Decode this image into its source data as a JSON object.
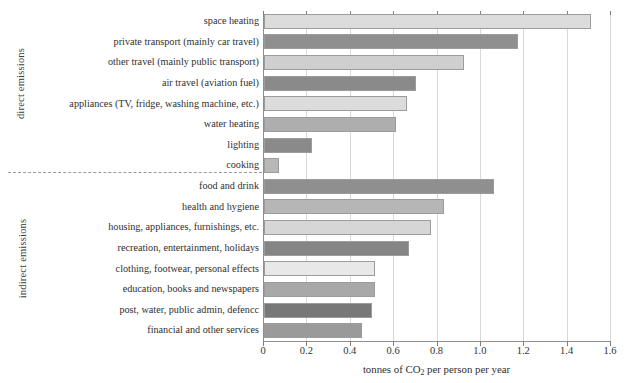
{
  "chart_data": {
    "type": "bar",
    "orientation": "horizontal",
    "title": "",
    "xlabel": "tonnes of CO2 per person per year",
    "xlabel_parts": {
      "before": "tonnes of CO",
      "sub": "2",
      "after": " per person per year"
    },
    "ylabel": "",
    "xlim": [
      0,
      1.6
    ],
    "xticks": [
      0,
      0.2,
      0.4,
      0.6,
      0.8,
      1.0,
      1.2,
      1.4,
      1.6
    ],
    "xtick_labels": [
      "0",
      "0.2",
      "0.4",
      "0.6",
      "0.8",
      "1.0",
      "1.2",
      "1.4",
      "1.6"
    ],
    "grid": true,
    "legend": "none",
    "groups": [
      {
        "name": "direct emissions",
        "categories": [
          "space heating",
          "private transport (mainly car travel)",
          "other travel (mainly public transport)",
          "air travel (aviation fuel)",
          "appliances (TV, fridge, washing machine, etc.)",
          "water heating",
          "lighting",
          "cooking"
        ],
        "values": [
          1.51,
          1.17,
          0.92,
          0.7,
          0.66,
          0.61,
          0.22,
          0.07
        ],
        "colors": [
          "#dcdcdc",
          "#8f8f8f",
          "#cfcfcf",
          "#8a8a8a",
          "#dcdcdc",
          "#aeaeae",
          "#8a8a8a",
          "#b8b8b8"
        ]
      },
      {
        "name": "indirect emissions",
        "categories": [
          "food and drink",
          "health and hygiene",
          "housing, appliances, furnishings, etc.",
          "recreation, entertainment, holidays",
          "clothing, footwear, personal effects",
          "education, books and newspapers",
          "post, water, public admin, defencc",
          "financial and other services"
        ],
        "values": [
          1.06,
          0.83,
          0.77,
          0.67,
          0.51,
          0.51,
          0.5,
          0.45
        ],
        "colors": [
          "#8f8f8f",
          "#b6b6b6",
          "#d6d6d6",
          "#858585",
          "#e8e8e8",
          "#a8a8a8",
          "#787878",
          "#9a9a9a"
        ]
      }
    ]
  },
  "axis_colors": {
    "axis_line": "#8e8e8e",
    "gridline": "#d8d8d8",
    "separator": "#9a9a9a",
    "text": "#2f2f2f"
  }
}
